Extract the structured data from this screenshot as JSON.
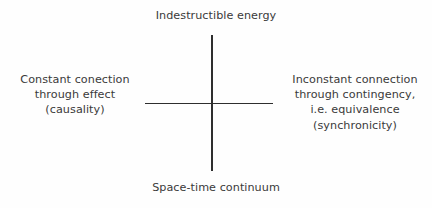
{
  "figure": {
    "kind": "cross-axis-diagram",
    "background_color": "#fefefe",
    "line_color": "#2e2e2e",
    "text_color": "#3a3a3a"
  },
  "labels": {
    "top": "Indestructible energy",
    "bottom": "Space-time continuum",
    "left": "Constant conection\nthrough effect\n(causality)",
    "right": "Inconstant connection\nthrough contingency,\ni.e. equivalence\n(synchronicity)"
  },
  "axes": {
    "vertical_name": "vertical-axis",
    "horizontal_name": "horizontal-axis"
  }
}
